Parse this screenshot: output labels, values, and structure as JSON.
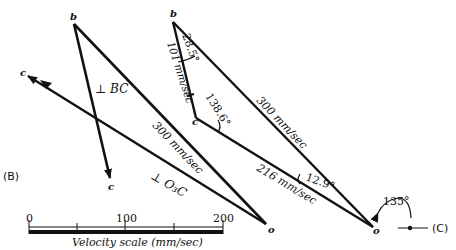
{
  "diagram": {
    "type": "velocity-polygon",
    "panel_b": {
      "label": "(B)",
      "points": {
        "b": "b",
        "c_top": "c",
        "c_bottom": "c",
        "o": "o"
      },
      "annotations": {
        "perp_bc": "⊥ BC",
        "perp_o3c": "⊥ O₃C",
        "vb": "300 mm/sec"
      }
    },
    "panel_c": {
      "label": "(C)",
      "points": {
        "b": "b",
        "c": "c",
        "o": "o"
      },
      "annotations": {
        "vbc": "101 mm/sec",
        "vb": "300 mm/sec",
        "vc": "216 mm/sec",
        "angle_b": "28.5°",
        "angle_c": "138.6°",
        "angle_o": "12.9°",
        "angle_ref": "135°"
      }
    },
    "scale": {
      "ticks": [
        "0",
        "100",
        "200"
      ],
      "caption": "Velocity scale (mm/sec)"
    }
  }
}
